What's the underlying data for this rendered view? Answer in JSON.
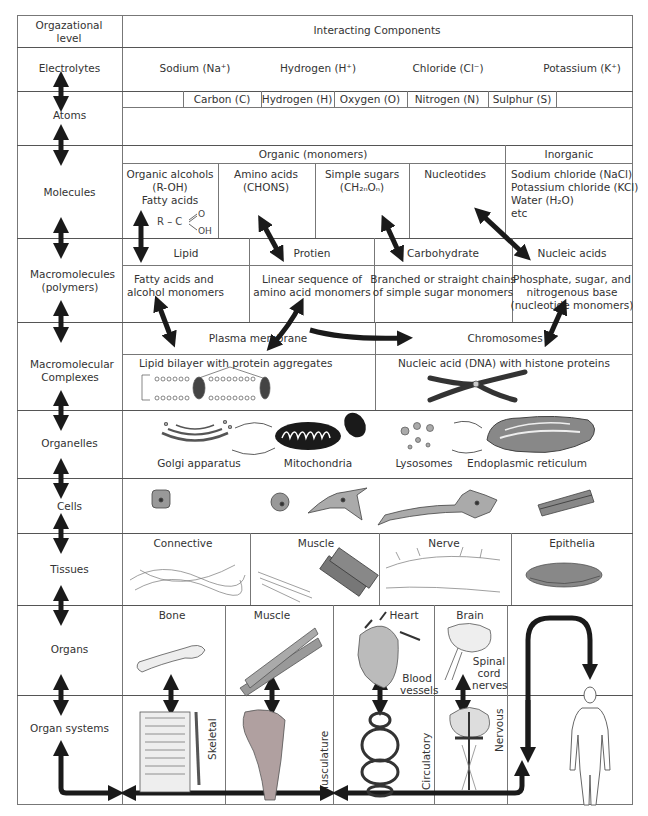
{
  "header": {
    "level_label": "Orgazational level",
    "components_label": "Interacting Components"
  },
  "levels": [
    {
      "name": "Electrolytes"
    },
    {
      "name": "Atoms"
    },
    {
      "name": "Molecules"
    },
    {
      "name": "Macromolecules (polymers)"
    },
    {
      "name": "Macromolecular Complexes"
    },
    {
      "name": "Organelles"
    },
    {
      "name": "Cells"
    },
    {
      "name": "Tissues"
    },
    {
      "name": "Organs"
    },
    {
      "name": "Organ systems"
    }
  ],
  "electrolytes": [
    "Sodium (Na⁺)",
    "Hydrogen (H⁺)",
    "Chloride (Cl⁻)",
    "Potassium (K⁺)"
  ],
  "atoms": [
    "Carbon (C)",
    "Hydrogen (H)",
    "Oxygen (O)",
    "Nitrogen (N)",
    "Sulphur (S)"
  ],
  "molecules": {
    "organic_header": "Organic (monomers)",
    "inorganic_header": "Inorganic",
    "organic": [
      {
        "lines": [
          "Organic alcohols",
          "(R-OH)",
          "Fatty acids"
        ],
        "formula": "R – C =O / –OH"
      },
      {
        "lines": [
          "Amino acids",
          "(CHONS)"
        ]
      },
      {
        "lines": [
          "Simple sugars",
          "(CH₂ₙOₙ)"
        ]
      },
      {
        "lines": [
          "Nucleotides"
        ]
      }
    ],
    "inorganic": [
      "Sodium chloride (NaCl)",
      "Potassium chloride (KCl)",
      "Water (H₂O)",
      "etc"
    ]
  },
  "macromolecules": [
    {
      "name": "Lipid",
      "desc": [
        "Fatty acids and",
        "alcohol monomers"
      ]
    },
    {
      "name": "Protien",
      "desc": [
        "Linear sequence of",
        "amino acid monomers"
      ]
    },
    {
      "name": "Carbohydrate",
      "desc": [
        "Branched or straight chains",
        "of simple sugar monomers"
      ]
    },
    {
      "name": "Nucleic acids",
      "desc": [
        "Phosphate, sugar, and",
        "nitrogenous base",
        "(nucleotide monomers)"
      ]
    }
  ],
  "complexes": [
    {
      "name": "Plasma membrane",
      "desc": "Lipid bilayer with protein aggregates"
    },
    {
      "name": "Chromosomes",
      "desc": "Nucleic acid (DNA) with histone proteins"
    }
  ],
  "organelles": [
    "Golgi apparatus",
    "Mitochondria",
    "Lysosomes",
    "Endoplasmic reticulum"
  ],
  "tissues": [
    "Connective",
    "Muscle",
    "Nerve",
    "Epithelia"
  ],
  "organs": {
    "items": [
      "Bone",
      "Muscle",
      "Heart",
      "Brain"
    ],
    "heart_label_2": "Blood vessels",
    "brain_label_2": "Spinal cord nerves"
  },
  "organ_systems": [
    "Skeletal",
    "Musculature",
    "Circulatory",
    "Nervous"
  ],
  "colors": {
    "line": "#555555",
    "arrow": "#1a1a1a",
    "text": "#333333"
  }
}
